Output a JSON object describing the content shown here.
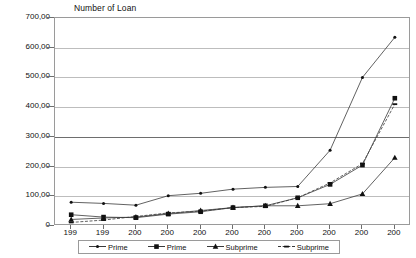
{
  "chart_data": {
    "type": "line",
    "title": "Number of Loan",
    "xlabel": "",
    "ylabel": "",
    "ylim": [
      0,
      700
    ],
    "ytick_step": 100,
    "ytick_labels": [
      "700,00",
      "600,00",
      "500,00",
      "400,00",
      "300,00",
      "200,00",
      "100,00",
      "0"
    ],
    "ytick_values": [
      700,
      600,
      500,
      400,
      300,
      200,
      100,
      0
    ],
    "grid": true,
    "legend_position": "bottom",
    "categories": [
      "199",
      "199",
      "200",
      "200",
      "200",
      "200",
      "200",
      "200",
      "200",
      "200",
      "200"
    ],
    "series": [
      {
        "name": "Prime",
        "marker": "dot",
        "line": "solid",
        "values": [
          80,
          76,
          70,
          102,
          110,
          124,
          130,
          133,
          255,
          500,
          635
        ]
      },
      {
        "name": "Prime",
        "marker": "square",
        "line": "solid",
        "values": [
          38,
          30,
          28,
          40,
          48,
          62,
          68,
          95,
          140,
          205,
          430
        ]
      },
      {
        "name": "Subprime",
        "marker": "triangle",
        "line": "solid",
        "values": [
          22,
          27,
          30,
          42,
          52,
          62,
          68,
          68,
          75,
          108,
          230
        ]
      },
      {
        "name": "Subprime",
        "marker": "dash",
        "line": "dashed",
        "values": [
          12,
          20,
          32,
          44,
          50,
          62,
          66,
          95,
          145,
          210,
          410
        ]
      }
    ]
  },
  "legend": {
    "items": [
      {
        "label": "Prime",
        "marker": "dot",
        "line": "solid"
      },
      {
        "label": "Prime",
        "marker": "square",
        "line": "solid"
      },
      {
        "label": "Subprime",
        "marker": "triangle",
        "line": "solid"
      },
      {
        "label": "Subprime",
        "marker": "dash",
        "line": "dashed"
      }
    ]
  },
  "colors": {
    "series_line": "#3a3a3a",
    "marker": "#111111",
    "gridline": "#bdbdbd",
    "gridline_major": "#6e6e6e",
    "axis": "#9a9a9a",
    "background": "#ffffff",
    "text": "#111111"
  }
}
